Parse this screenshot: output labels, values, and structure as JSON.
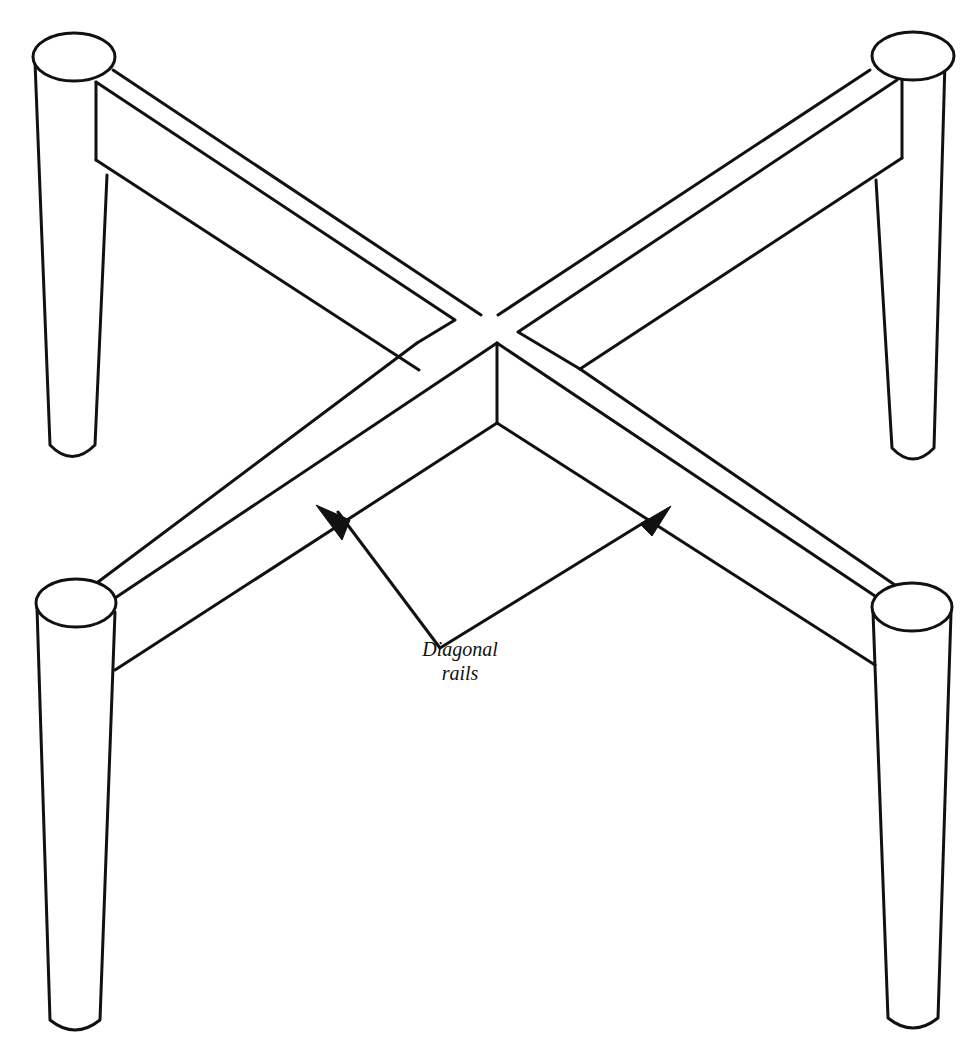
{
  "diagram": {
    "stroke_color": "#111111",
    "background_color": "#ffffff",
    "annotation": {
      "line1": "Diagonal",
      "line2": "rails"
    },
    "parts": [
      {
        "name": "leg",
        "position": "back-left"
      },
      {
        "name": "leg",
        "position": "back-right"
      },
      {
        "name": "leg",
        "position": "front-left"
      },
      {
        "name": "leg",
        "position": "front-right"
      },
      {
        "name": "diagonal rail",
        "from": "back-left",
        "to": "front-right"
      },
      {
        "name": "diagonal rail",
        "from": "back-right",
        "to": "front-left"
      }
    ],
    "arrows": 2
  }
}
